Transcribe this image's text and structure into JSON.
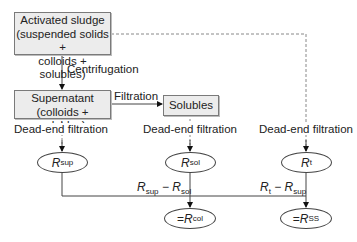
{
  "diagram": {
    "boxes": {
      "activated_sludge": {
        "line1": "Activated sludge",
        "line2": "(suspended solids +",
        "line3": "colloids + solubles)"
      },
      "supernatant": {
        "line1": "Supernatant",
        "line2": "(colloids + solubles)"
      },
      "solubles": {
        "line1": "Solubles"
      }
    },
    "edge_labels": {
      "centrifugation": "Centrifugation",
      "filtration": "Filtration",
      "dead_end_1": "Dead-end filtration",
      "dead_end_2": "Dead-end filtration",
      "dead_end_3": "Dead-end filtration"
    },
    "nodes": {
      "r_sup": {
        "symbol": "R",
        "sub": "sup"
      },
      "r_sol": {
        "symbol": "R",
        "sub": "sol"
      },
      "r_t": {
        "symbol": "R",
        "sub": "t"
      },
      "r_col": {
        "prefix": "= ",
        "symbol": "R",
        "sub": "col"
      },
      "r_ss": {
        "prefix": "= ",
        "symbol": "R",
        "sub": "SS"
      }
    },
    "expressions": {
      "col_expr": {
        "a": "R",
        "a_sub": "sup",
        "op": " − ",
        "b": "R",
        "b_sub": "sol"
      },
      "ss_expr": {
        "a": "R",
        "a_sub": "t",
        "op": " − ",
        "b": "R",
        "b_sub": "sup"
      }
    }
  }
}
